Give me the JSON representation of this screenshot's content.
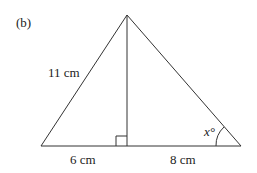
{
  "figure": {
    "part_label": "(b)",
    "labels": {
      "hypotenuse_left": "11 cm",
      "base_left": "6 cm",
      "base_right": "8 cm",
      "angle": "x°"
    },
    "geometry": {
      "apex": [
        127,
        15
      ],
      "base_left": [
        41,
        146
      ],
      "base_right": [
        241,
        146
      ],
      "foot": [
        127,
        146
      ],
      "right_angle_marker": true
    },
    "colors": {
      "stroke": "#333333",
      "text": "#222222"
    }
  }
}
